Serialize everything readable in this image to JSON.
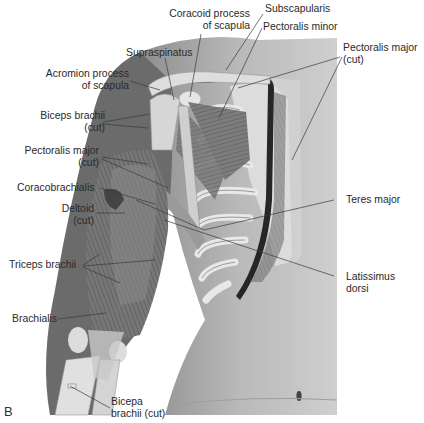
{
  "figure": {
    "panel_letter": "B",
    "labels": [
      {
        "id": "coracoid",
        "line1": "Coracoid process",
        "line2": "of scapula"
      },
      {
        "id": "subscapularis",
        "line1": "Subscapularis"
      },
      {
        "id": "pectoralis_minor",
        "line1": "Pectoralis minor"
      },
      {
        "id": "supraspinatus",
        "line1": "Supraspinatus"
      },
      {
        "id": "pectoralis_major_cut_right",
        "line1": "Pectoralis major",
        "line2": "(cut)"
      },
      {
        "id": "acromion",
        "line1": "Acromion process",
        "line2": "of scapula"
      },
      {
        "id": "biceps_cut_top",
        "line1": "Biceps brachii",
        "line2": "(cut)"
      },
      {
        "id": "pectoralis_major_cut_left",
        "line1": "Pectoralis major",
        "line2": "(cut)"
      },
      {
        "id": "coracobrachialis",
        "line1": "Coracobrachialis"
      },
      {
        "id": "teres_major",
        "line1": "Teres major"
      },
      {
        "id": "deltoid",
        "line1": "Deltoid",
        "line2": "(cut)"
      },
      {
        "id": "triceps",
        "line1": "Triceps brachii"
      },
      {
        "id": "latissimus",
        "line1": "Latissimus",
        "line2": "dorsi"
      },
      {
        "id": "brachialis",
        "line1": "Brachialis"
      },
      {
        "id": "biceps_cut_bottom",
        "line1": "Bicepa",
        "line2": "brachii (cut)"
      }
    ]
  },
  "colors": {
    "background": "#ffffff",
    "skin": "#a9a9a9",
    "skin_light": "#c9c9c9",
    "muscle": "#7a7a7a",
    "bone": "#e4e4e4",
    "text": "#2a2a2a",
    "leader": "#3a3a3a"
  }
}
